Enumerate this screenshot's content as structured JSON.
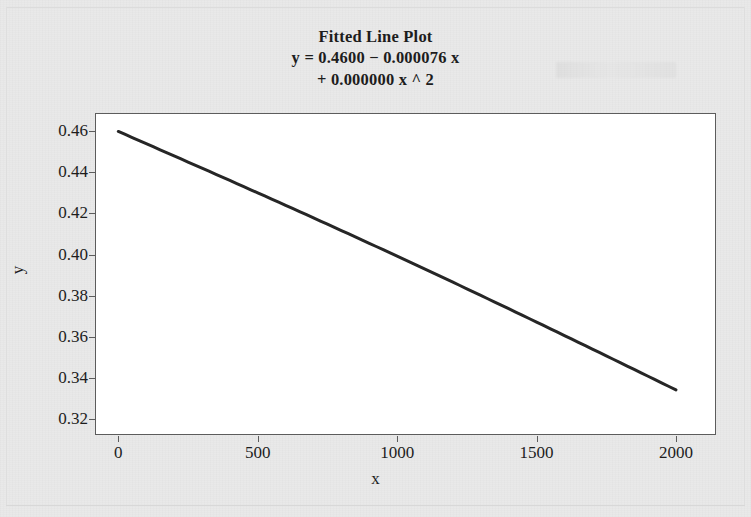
{
  "chart_data": {
    "type": "line",
    "title": "Fitted Line Plot",
    "title_lines": [
      "Fitted Line Plot",
      "y = 0.4600 − 0.000076 x",
      "+ 0.000000 x ^ 2"
    ],
    "equation": {
      "intercept": "0.4600",
      "linear_term": "− 0.000076 x",
      "quadratic_term": "+ 0.000000 x ^ 2"
    },
    "xlabel": "x",
    "ylabel": "y",
    "xlim": [
      -80,
      2140
    ],
    "ylim": [
      0.3125,
      0.4685
    ],
    "xticks": [
      0,
      500,
      1000,
      1500,
      2000
    ],
    "xtick_labels": [
      "0",
      "500",
      "1000",
      "1500",
      "2000"
    ],
    "yticks": [
      0.32,
      0.34,
      0.36,
      0.38,
      0.4,
      0.42,
      0.44,
      0.46
    ],
    "ytick_labels": [
      "0.32",
      "0.34",
      "0.36",
      "0.38",
      "0.40",
      "0.42",
      "0.44",
      "0.46"
    ],
    "grid": false,
    "legend": null,
    "series": [
      {
        "name": "fitted line",
        "color": "#262626",
        "line_width": 3,
        "x": [
          0,
          200,
          400,
          600,
          800,
          1000,
          1200,
          1400,
          1600,
          1800,
          2000
        ],
        "y": [
          0.46,
          0.4448,
          0.4296,
          0.4146,
          0.3998,
          0.3851,
          0.3706,
          0.3562,
          0.342,
          0.3279,
          0.334
        ]
      }
    ],
    "fitted_values": {
      "x_start": 0,
      "y_start": 0.46,
      "x_end": 2000,
      "y_end": 0.334
    }
  },
  "colors": {
    "background": "#e9e9e9",
    "plot_background": "#ffffff",
    "axis": "#5c5c5c",
    "text": "#1d1d1d",
    "line": "#262626"
  }
}
